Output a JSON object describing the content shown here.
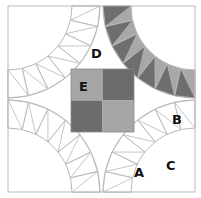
{
  "diagram": {
    "labels": {
      "a": "A",
      "b": "B",
      "c": "C",
      "d": "D",
      "e": "E"
    },
    "colors": {
      "background": "#ffffff",
      "outline": "#b8b8b8",
      "arc_light": "#a8a8a8",
      "arc_dark": "#6e6e6e",
      "center_light": "#a6a6a6",
      "center_dark": "#6c6c6c"
    }
  }
}
